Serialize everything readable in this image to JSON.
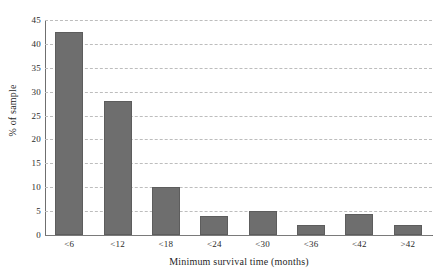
{
  "chart_data": {
    "type": "bar",
    "title": "",
    "subtitle": "",
    "xlabel": "Minimum survival time (months)",
    "ylabel": "% of sample",
    "categories": [
      "<6",
      "<12",
      "<18",
      "<24",
      "<30",
      "<36",
      "<42",
      ">42"
    ],
    "values": [
      42.5,
      28.0,
      10.0,
      4.0,
      5.0,
      2.0,
      4.3,
      2.0
    ],
    "series": [
      {
        "name": "% of sample",
        "values": [
          42.5,
          28.0,
          10.0,
          4.0,
          5.0,
          2.0,
          4.3,
          2.0
        ]
      }
    ],
    "ylim": [
      0,
      45
    ],
    "ytick_step": 5,
    "yticks": [
      "45",
      "40",
      "35",
      "30",
      "25",
      "20",
      "15",
      "10",
      "5",
      "0"
    ],
    "ytick_values": [
      45,
      40,
      35,
      30,
      25,
      20,
      15,
      10,
      5,
      0
    ],
    "grid": "horizontal-dashed",
    "legend": "none",
    "bar_color": "#6e6e6e",
    "grid_color": "#bdbdbd",
    "axis_color": "#6f6f6f",
    "text_color": "#2b2b2b",
    "background": "#ffffff"
  }
}
